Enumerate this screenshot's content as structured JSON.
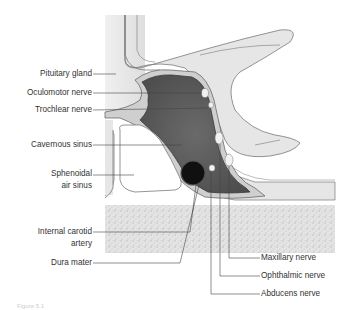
{
  "figure": {
    "caption": "Figure 5.1",
    "colors": {
      "background": "#ffffff",
      "bone_light": "#e6e6e6",
      "dura_outline": "#6a6a6a",
      "sinus_fill": "#5e5e5e",
      "sinus_rim": "#8c8c8c",
      "carotid": "#111111",
      "nerve": "#f2f2f2",
      "stipple_bone": "#d8d8d8",
      "label_text": "#333333",
      "leader_line": "#444444"
    }
  },
  "labels": {
    "left": [
      {
        "id": "pituitary",
        "text": "Pituitary gland"
      },
      {
        "id": "oculomotor",
        "text": "Oculomotor nerve"
      },
      {
        "id": "trochlear",
        "text": "Trochlear nerve"
      },
      {
        "id": "cavernous",
        "text": "Cavernous sinus"
      },
      {
        "id": "sphenoidal_1",
        "text": "Sphenoidal"
      },
      {
        "id": "sphenoidal_2",
        "text": "air sinus"
      },
      {
        "id": "carotid_1",
        "text": "Internal carotid"
      },
      {
        "id": "carotid_2",
        "text": "artery"
      },
      {
        "id": "dura",
        "text": "Dura mater"
      }
    ],
    "right": [
      {
        "id": "maxillary",
        "text": "Maxillary nerve"
      },
      {
        "id": "ophthalmic",
        "text": "Ophthalmic nerve"
      },
      {
        "id": "abducens",
        "text": "Abducens nerve"
      }
    ]
  }
}
